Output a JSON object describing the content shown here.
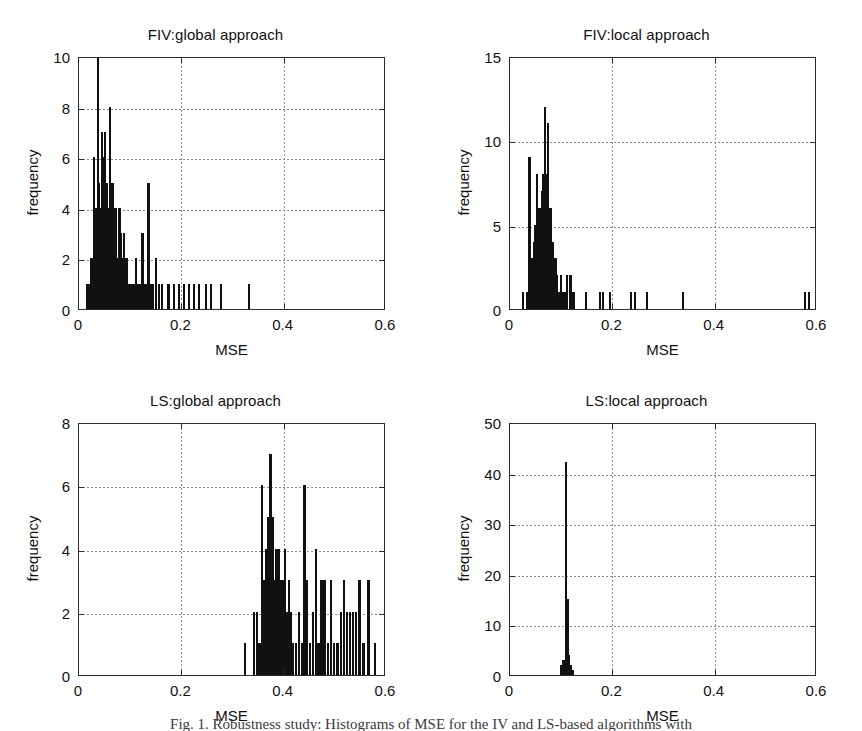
{
  "figure": {
    "caption": "Fig. 1. Robustness study: Histograms of MSE for the IV and LS-based algorithms with",
    "bar_color": "#111111",
    "axis_color": "#2b2b2b",
    "grid_color": "#8c8c8c",
    "background": "#ffffff"
  },
  "common": {
    "xlabel": "MSE",
    "ylabel": "frequency",
    "xlim": [
      0,
      0.6
    ],
    "xticks": [
      0,
      0.2,
      0.4,
      0.6
    ],
    "xticklabels": [
      "0",
      "0.2",
      "0.4",
      "0.6"
    ]
  },
  "chart_data": [
    {
      "id": "fiv-global",
      "type": "bar",
      "title": "FIV:global approach",
      "xlabel": "MSE",
      "ylabel": "frequency",
      "xlim": [
        0,
        0.6
      ],
      "ylim": [
        0,
        10
      ],
      "xticks": [
        0,
        0.2,
        0.4,
        0.6
      ],
      "xticklabels": [
        "0",
        "0.2",
        "0.4",
        "0.6"
      ],
      "yticks": [
        0,
        2,
        4,
        6,
        8,
        10
      ],
      "yticklabels": [
        "0",
        "2",
        "4",
        "6",
        "8",
        "10"
      ],
      "grid": true,
      "legend": null,
      "bin_width": 0.0045,
      "x": [
        0.016,
        0.02,
        0.024,
        0.027,
        0.029,
        0.031,
        0.033,
        0.035,
        0.037,
        0.039,
        0.041,
        0.043,
        0.045,
        0.047,
        0.049,
        0.051,
        0.053,
        0.055,
        0.057,
        0.059,
        0.061,
        0.063,
        0.065,
        0.067,
        0.069,
        0.071,
        0.073,
        0.075,
        0.077,
        0.079,
        0.082,
        0.085,
        0.088,
        0.091,
        0.094,
        0.097,
        0.1,
        0.104,
        0.108,
        0.112,
        0.116,
        0.12,
        0.124,
        0.128,
        0.132,
        0.136,
        0.14,
        0.145,
        0.15,
        0.156,
        0.162,
        0.175,
        0.185,
        0.195,
        0.205,
        0.215,
        0.225,
        0.235,
        0.248,
        0.258,
        0.278,
        0.332
      ],
      "values": [
        1,
        1,
        2,
        2,
        6,
        4,
        4,
        4,
        10,
        5,
        4,
        3,
        7,
        6,
        4,
        7,
        4,
        5,
        3,
        4,
        8,
        5,
        3,
        5,
        4,
        3,
        4,
        2,
        2,
        4,
        3,
        2,
        3,
        2,
        2,
        1,
        1,
        1,
        1,
        2,
        1,
        1,
        3,
        1,
        1,
        5,
        1,
        1,
        2,
        1,
        1,
        1,
        1,
        1,
        1,
        1,
        1,
        1,
        1,
        1,
        1,
        1
      ]
    },
    {
      "id": "fiv-local",
      "type": "bar",
      "title": "FIV:local approach",
      "xlabel": "MSE",
      "ylabel": "frequency",
      "xlim": [
        0,
        0.6
      ],
      "ylim": [
        0,
        15
      ],
      "xticks": [
        0,
        0.2,
        0.4,
        0.6
      ],
      "xticklabels": [
        "0",
        "0.2",
        "0.4",
        "0.6"
      ],
      "yticks": [
        0,
        5,
        10,
        15
      ],
      "yticklabels": [
        "0",
        "5",
        "10",
        "15"
      ],
      "grid": true,
      "legend": null,
      "bin_width": 0.0045,
      "x": [
        0.026,
        0.034,
        0.038,
        0.041,
        0.044,
        0.047,
        0.05,
        0.053,
        0.056,
        0.059,
        0.062,
        0.065,
        0.068,
        0.071,
        0.074,
        0.077,
        0.08,
        0.083,
        0.086,
        0.089,
        0.092,
        0.096,
        0.1,
        0.104,
        0.108,
        0.112,
        0.118,
        0.124,
        0.148,
        0.176,
        0.182,
        0.196,
        0.236,
        0.244,
        0.268,
        0.338,
        0.576,
        0.584
      ],
      "values": [
        1,
        1,
        9,
        2,
        3,
        4,
        5,
        8,
        6,
        6,
        7,
        8,
        12,
        8,
        11,
        6,
        6,
        4,
        3,
        3,
        2,
        1,
        2,
        1,
        1,
        2,
        2,
        1,
        1,
        1,
        1,
        1,
        1,
        1,
        1,
        1,
        1,
        1
      ]
    },
    {
      "id": "ls-global",
      "type": "bar",
      "title": "LS:global approach",
      "xlabel": "MSE",
      "ylabel": "frequency",
      "xlim": [
        0,
        0.6
      ],
      "ylim": [
        0,
        8
      ],
      "xticks": [
        0,
        0.2,
        0.4,
        0.6
      ],
      "xticklabels": [
        "0",
        "0.2",
        "0.4",
        "0.6"
      ],
      "yticks": [
        0,
        2,
        4,
        6,
        8
      ],
      "yticklabels": [
        "0",
        "2",
        "4",
        "6",
        "8"
      ],
      "grid": true,
      "legend": null,
      "bin_width": 0.0045,
      "x": [
        0.325,
        0.342,
        0.348,
        0.353,
        0.358,
        0.362,
        0.366,
        0.37,
        0.374,
        0.378,
        0.382,
        0.386,
        0.39,
        0.394,
        0.398,
        0.402,
        0.406,
        0.41,
        0.414,
        0.418,
        0.424,
        0.43,
        0.436,
        0.441,
        0.446,
        0.452,
        0.458,
        0.463,
        0.468,
        0.474,
        0.48,
        0.486,
        0.492,
        0.498,
        0.505,
        0.512,
        0.518,
        0.524,
        0.53,
        0.536,
        0.542,
        0.548,
        0.556,
        0.566,
        0.578
      ],
      "values": [
        1,
        2,
        2,
        1,
        6,
        3,
        4,
        5,
        7,
        5,
        3,
        4,
        4,
        3,
        3,
        4,
        2,
        3,
        2,
        1,
        1,
        2,
        1,
        6,
        3,
        1,
        2,
        4,
        1,
        3,
        3,
        1,
        3,
        1,
        1,
        2,
        3,
        2,
        2,
        2,
        2,
        3,
        1,
        3,
        1
      ]
    },
    {
      "id": "ls-local",
      "type": "bar",
      "title": "LS:local approach",
      "xlabel": "MSE",
      "ylabel": "frequency",
      "xlim": [
        0,
        0.6
      ],
      "ylim": [
        0,
        50
      ],
      "xticks": [
        0,
        0.2,
        0.4,
        0.6
      ],
      "xticklabels": [
        "0",
        "0.2",
        "0.4",
        "0.6"
      ],
      "yticks": [
        0,
        10,
        20,
        30,
        40,
        50
      ],
      "yticklabels": [
        "0",
        "10",
        "20",
        "30",
        "40",
        "50"
      ],
      "grid": true,
      "legend": null,
      "bin_width": 0.0045,
      "x": [
        0.1,
        0.104,
        0.107,
        0.11,
        0.113,
        0.116,
        0.119,
        0.122
      ],
      "values": [
        2,
        3,
        3,
        42,
        15,
        4,
        2,
        1
      ]
    }
  ]
}
